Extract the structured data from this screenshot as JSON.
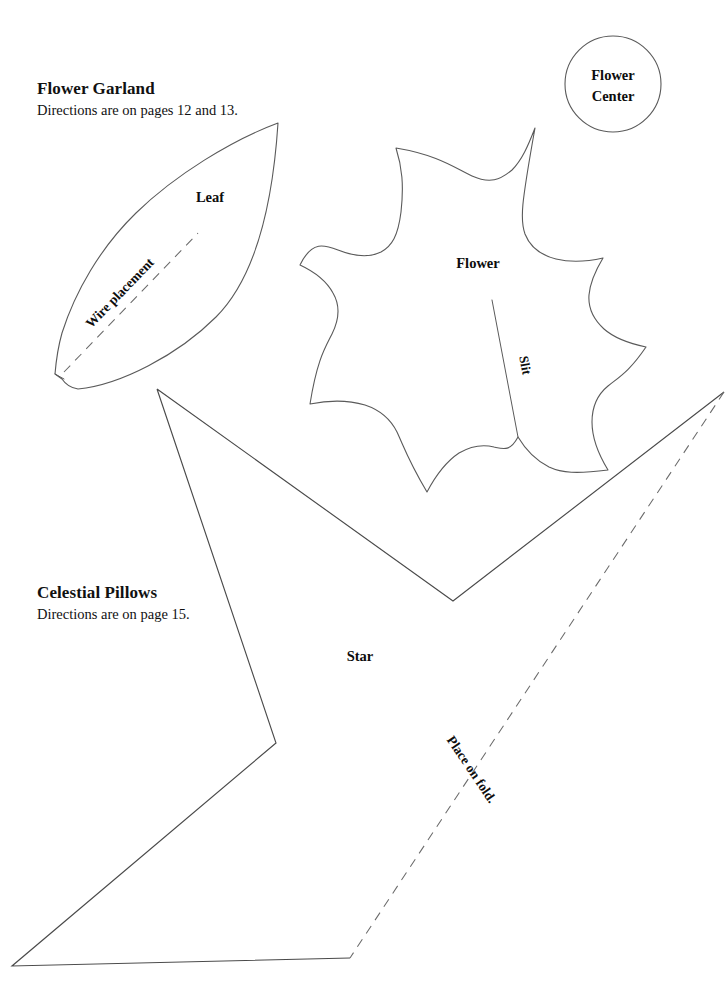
{
  "page": {
    "width": 727,
    "height": 984,
    "background_color": "#ffffff",
    "ink_color": "#5a5a5a",
    "text_color": "#0d0d0d"
  },
  "sections": [
    {
      "id": "flower-garland",
      "title": "Flower Garland",
      "subtitle": "Directions are on pages 12 and 13.",
      "x": 37,
      "y": 78
    },
    {
      "id": "celestial-pillows",
      "title": "Celestial Pillows",
      "subtitle": "Directions are on page 15.",
      "x": 37,
      "y": 582
    }
  ],
  "pattern_pieces": [
    {
      "id": "flower-center",
      "label": "Flower Center",
      "label_line_1": "Flower",
      "label_line_2": "Center",
      "shape": "circle",
      "cx": 613,
      "cy": 84,
      "r": 48,
      "label_x": 613,
      "label_y": 79
    },
    {
      "id": "leaf",
      "label": "Leaf",
      "shape": "leaf",
      "label_x": 210,
      "label_y": 202,
      "tip_x": 278,
      "tip_y": 123,
      "base_x": 55,
      "base_y": 382
    },
    {
      "id": "flower",
      "label": "Flower",
      "shape": "star-petal-flower",
      "label_x": 478,
      "label_y": 268,
      "petal_count": 9
    },
    {
      "id": "star",
      "label": "Star",
      "shape": "star-point",
      "label_x": 360,
      "label_y": 661
    }
  ],
  "annotations": [
    {
      "id": "wire-placement",
      "text": "Wire placement",
      "type": "dashed-guide",
      "rotation_deg": -50,
      "x": 123,
      "y": 295,
      "line_from": [
        64,
        372
      ],
      "line_to": [
        196,
        235
      ]
    },
    {
      "id": "slit",
      "text": "Slit",
      "type": "cut-line",
      "rotation_deg": 80,
      "x": 520,
      "y": 365,
      "line_from": [
        492,
        300
      ],
      "line_to": [
        518,
        437
      ]
    },
    {
      "id": "place-on-fold",
      "text": "Place on fold.",
      "type": "dashed-fold",
      "rotation_deg": -33,
      "x": 468,
      "y": 775,
      "line_from": [
        724,
        392
      ],
      "line_to": [
        350,
        958
      ]
    }
  ]
}
